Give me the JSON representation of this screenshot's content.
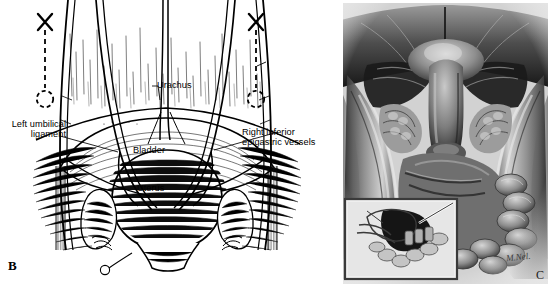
{
  "figure": {
    "background_color": "#ffffff",
    "width": 551,
    "height": 287
  },
  "panel_b": {
    "letter": "B",
    "style": "pen-and-ink line drawing",
    "ink_color": "#000000",
    "paper_color": "#ffffff",
    "labels": {
      "urachus": "Urachus",
      "bladder": "Bladder",
      "uterus": "Uterus",
      "left_umbilical_ligament": "Left umbilical\nligament",
      "right_inferior_epigastric_vessels": "Right inferior\nepigastric vessels"
    },
    "markers": {
      "left_trocar_x": "✖",
      "right_trocar_x": "✖",
      "marker_note": "X mark above dashed leader line ending in dashed circle (trocar insertion site)"
    }
  },
  "panel_c": {
    "letter": "C",
    "style": "grayscale airbrush anatomical rendering",
    "frame_color": "#c8c8c8",
    "signature": "M.Nel.",
    "inset": {
      "present": true,
      "description": "sagittal pelvic inset with dark bladder dome and coiled bowel"
    }
  }
}
